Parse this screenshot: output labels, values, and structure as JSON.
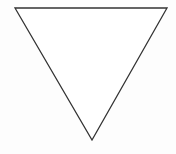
{
  "diagram": {
    "shape": "inverted-triangle",
    "vertices": [
      [
        15,
        8
      ],
      [
        167,
        8
      ],
      [
        92,
        140
      ]
    ],
    "stroke_color": "#333333",
    "fill_color": "#ffffff",
    "stroke_width": 1.3
  }
}
